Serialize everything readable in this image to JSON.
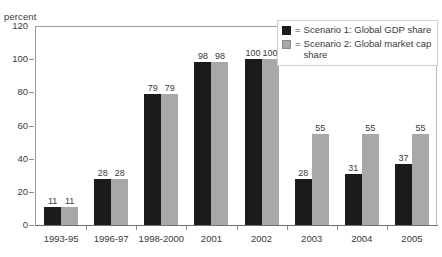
{
  "title_remnant": "",
  "axis": {
    "ylabel": "percent",
    "yticks": [
      0,
      20,
      40,
      60,
      80,
      100,
      120
    ]
  },
  "legend": {
    "equals": "=",
    "entries": [
      {
        "label": "Scenario 1: Global GDP share",
        "color": "#1b1b1b",
        "name": "scenario-1"
      },
      {
        "label": "Scenario 2: Global market cap share",
        "color": "#a8a8a8",
        "name": "scenario-2"
      }
    ]
  },
  "chart_data": {
    "type": "bar",
    "title": "",
    "xlabel": "",
    "ylabel": "percent",
    "ylim": [
      0,
      120
    ],
    "yticks": [
      0,
      20,
      40,
      60,
      80,
      100,
      120
    ],
    "grid": false,
    "legend_position": "top-right",
    "categories": [
      "1993-95",
      "1996-97",
      "1998-2000",
      "2001",
      "2002",
      "2003",
      "2004",
      "2005"
    ],
    "series": [
      {
        "name": "Scenario 1: Global GDP share",
        "color": "#1b1b1b",
        "values": [
          11,
          28,
          79,
          98,
          100,
          28,
          31,
          37
        ]
      },
      {
        "name": "Scenario 2: Global market cap share",
        "color": "#a8a8a8",
        "values": [
          11,
          28,
          79,
          98,
          100,
          55,
          55,
          55
        ]
      }
    ]
  }
}
